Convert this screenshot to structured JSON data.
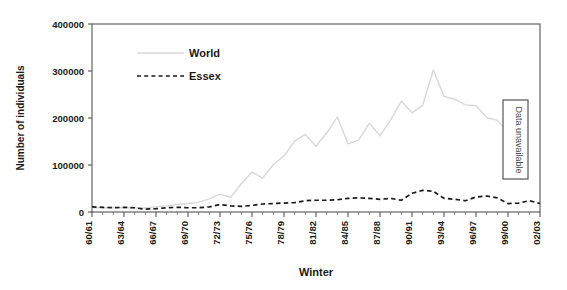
{
  "chart_data": {
    "type": "line",
    "title": "",
    "xlabel": "Winter",
    "ylabel": "Number of individuals",
    "ylim": [
      0,
      400000
    ],
    "ytick_labels": [
      "0",
      "100000",
      "200000",
      "300000",
      "400000"
    ],
    "ytick_values": [
      0,
      100000,
      200000,
      300000,
      400000
    ],
    "grid": false,
    "legend_position": "top-center",
    "x": [
      "60/61",
      "61/62",
      "62/63",
      "63/64",
      "64/65",
      "65/66",
      "66/67",
      "67/68",
      "68/69",
      "69/70",
      "70/71",
      "71/72",
      "72/73",
      "73/74",
      "74/75",
      "75/76",
      "76/77",
      "77/78",
      "78/79",
      "79/80",
      "80/81",
      "81/82",
      "82/83",
      "83/84",
      "84/85",
      "85/86",
      "86/87",
      "87/88",
      "88/89",
      "89/90",
      "90/91",
      "91/92",
      "92/93",
      "93/94",
      "94/95",
      "95/96",
      "96/97",
      "97/98",
      "98/99",
      "99/00",
      "00/01",
      "01/02",
      "02/03"
    ],
    "xtick_labels": [
      "60/61",
      "63/64",
      "66/67",
      "69/70",
      "72/73",
      "75/76",
      "78/79",
      "81/82",
      "84/85",
      "87/88",
      "90/91",
      "93/94",
      "96/97",
      "99/00",
      "02/03"
    ],
    "series": [
      {
        "name": "World",
        "color": "#d8d8d8",
        "style": "solid",
        "values": [
          9000,
          9000,
          9500,
          9000,
          8500,
          9000,
          11000,
          13000,
          16000,
          18000,
          21000,
          28000,
          38000,
          31000,
          60000,
          85000,
          72000,
          101000,
          119000,
          151000,
          165000,
          140000,
          168000,
          202000,
          145000,
          153000,
          189000,
          162000,
          196000,
          236000,
          211000,
          227000,
          302000,
          246000,
          240000,
          228000,
          226000,
          201000,
          195000,
          170000,
          null,
          null,
          null
        ]
      },
      {
        "name": "Essex",
        "color": "#1a1a1a",
        "style": "dashed",
        "values": [
          11000,
          10000,
          9000,
          10000,
          9000,
          6000,
          7000,
          9000,
          10000,
          9000,
          9000,
          11000,
          16000,
          13000,
          12000,
          14000,
          17000,
          18000,
          19000,
          20000,
          24000,
          25000,
          25000,
          26000,
          29000,
          30000,
          29000,
          27000,
          29000,
          25000,
          40000,
          46000,
          44000,
          29000,
          27000,
          24000,
          32000,
          34000,
          30000,
          18000,
          19000,
          24000,
          18000
        ]
      }
    ],
    "annotations": [
      {
        "text": "Data unavailable",
        "orientation": "vertical",
        "boxed": true
      }
    ]
  }
}
